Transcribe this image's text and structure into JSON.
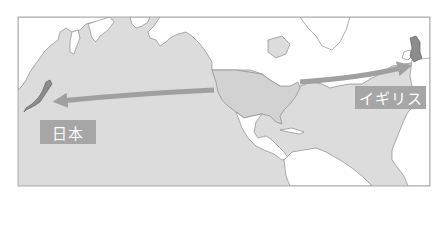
{
  "map": {
    "region": "North Pacific and North Atlantic",
    "colors": {
      "ocean": "#dcdcdc",
      "land": "#ffffff",
      "highlight_usa": "#d2d2d2",
      "highlight_countries": "#8c8c8c",
      "coastline": "#7a7a7a",
      "arrow": "#a0a0a0",
      "label_bg": "#a6a6a6",
      "label_text": "#ffffff"
    },
    "labels": {
      "japan": "日本",
      "uk": "イギリス"
    },
    "arrows": [
      {
        "from": "United States",
        "to": "日本"
      },
      {
        "from": "United States",
        "to": "イギリス"
      }
    ],
    "highlighted_countries": [
      "日本",
      "United States",
      "イギリス"
    ]
  }
}
